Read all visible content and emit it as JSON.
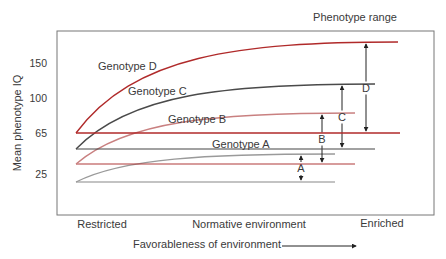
{
  "chart_data": {
    "type": "line",
    "title": "Phenotype range",
    "xlabel": "Favorableness of environment",
    "ylabel": "Mean phenotype IQ",
    "x_tick_labels": [
      "Restricted",
      "Normative environment",
      "Enriched"
    ],
    "y_ticks": [
      25,
      65,
      100,
      150
    ],
    "x_range": [
      0,
      1
    ],
    "grid": false,
    "series": [
      {
        "name": "Genotype A",
        "range_label": "A",
        "color": "#9a9a9a",
        "start": 15,
        "end": 45,
        "range_line_value": 15
      },
      {
        "name": "Genotype B",
        "range_label": "B",
        "color": "#c98080",
        "start": 35,
        "end": 85,
        "range_line_value": 35
      },
      {
        "name": "Genotype C",
        "range_label": "C",
        "color": "#4a4a4a",
        "start": 50,
        "end": 120,
        "range_line_value": 50
      },
      {
        "name": "Genotype D",
        "range_label": "D",
        "color": "#b02a2a",
        "start": 65,
        "end": 170,
        "range_line_value": 65
      }
    ]
  }
}
